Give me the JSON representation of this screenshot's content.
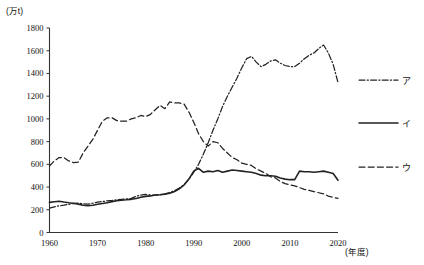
{
  "chart_data": {
    "type": "line",
    "title": "",
    "xlabel": "(年度)",
    "ylabel": "(万t)",
    "xlim": [
      1960,
      2020
    ],
    "ylim": [
      0,
      1800
    ],
    "grid": false,
    "legend_position": "right",
    "y_ticks": [
      0,
      200,
      400,
      600,
      800,
      1000,
      1200,
      1400,
      1600,
      1800
    ],
    "x_ticks": [
      1960,
      1970,
      1980,
      1990,
      2000,
      2010,
      2020
    ],
    "x": [
      1960,
      1961,
      1962,
      1963,
      1964,
      1965,
      1966,
      1967,
      1968,
      1969,
      1970,
      1971,
      1972,
      1973,
      1974,
      1975,
      1976,
      1977,
      1978,
      1979,
      1980,
      1981,
      1982,
      1983,
      1984,
      1985,
      1986,
      1987,
      1988,
      1989,
      1990,
      1991,
      1992,
      1993,
      1994,
      1995,
      1996,
      1997,
      1998,
      1999,
      2000,
      2001,
      2002,
      2003,
      2004,
      2005,
      2006,
      2007,
      2008,
      2009,
      2010,
      2011,
      2012,
      2013,
      2014,
      2015,
      2016,
      2017,
      2018,
      2019,
      2020
    ],
    "series": [
      {
        "name": "ア",
        "legend_label": "ア",
        "style": "dash-dot",
        "values": [
          215,
          225,
          235,
          240,
          248,
          255,
          258,
          252,
          250,
          258,
          268,
          272,
          278,
          282,
          288,
          292,
          296,
          300,
          318,
          330,
          335,
          330,
          328,
          332,
          340,
          352,
          368,
          392,
          420,
          470,
          530,
          600,
          690,
          790,
          900,
          1000,
          1110,
          1200,
          1280,
          1360,
          1450,
          1530,
          1550,
          1500,
          1460,
          1480,
          1510,
          1520,
          1490,
          1470,
          1460,
          1460,
          1490,
          1530,
          1560,
          1580,
          1620,
          1650,
          1580,
          1480,
          1320
        ]
      },
      {
        "name": "イ",
        "legend_label": "イ",
        "style": "solid",
        "values": [
          265,
          270,
          275,
          268,
          262,
          258,
          250,
          240,
          235,
          240,
          248,
          255,
          262,
          272,
          280,
          285,
          288,
          292,
          300,
          310,
          318,
          322,
          330,
          332,
          338,
          345,
          360,
          385,
          420,
          470,
          540,
          565,
          530,
          540,
          535,
          545,
          530,
          540,
          550,
          545,
          540,
          535,
          530,
          520,
          505,
          500,
          500,
          495,
          480,
          470,
          465,
          465,
          540,
          535,
          535,
          530,
          535,
          540,
          530,
          520,
          460
        ]
      },
      {
        "name": "ウ",
        "legend_label": "ウ",
        "style": "dashed",
        "values": [
          585,
          630,
          660,
          660,
          630,
          615,
          620,
          700,
          760,
          820,
          900,
          980,
          1010,
          1010,
          985,
          980,
          980,
          1000,
          1010,
          1030,
          1020,
          1040,
          1080,
          1120,
          1090,
          1150,
          1140,
          1140,
          1130,
          1060,
          970,
          870,
          800,
          760,
          800,
          790,
          740,
          700,
          660,
          640,
          610,
          600,
          590,
          560,
          540,
          520,
          490,
          480,
          450,
          430,
          420,
          410,
          395,
          380,
          370,
          360,
          350,
          340,
          320,
          310,
          300
        ]
      }
    ]
  }
}
